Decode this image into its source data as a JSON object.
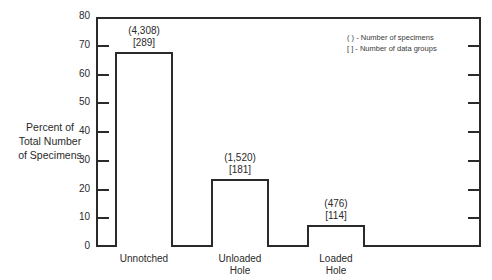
{
  "chart_data": {
    "type": "bar",
    "title": "",
    "xlabel": "",
    "ylabel": "Percent of Total Number of Specimens",
    "ylabel_lines": [
      "Percent of",
      "Total Number",
      "of Specimens"
    ],
    "ylim": [
      0,
      80
    ],
    "yticks": [
      0,
      10,
      20,
      30,
      40,
      50,
      60,
      70,
      80
    ],
    "categories": [
      "Unnotched",
      "Unloaded Hole",
      "Loaded Hole"
    ],
    "category_lines": [
      [
        "Unnotched"
      ],
      [
        "Unloaded",
        "Hole"
      ],
      [
        "Loaded",
        "Hole"
      ]
    ],
    "values": [
      68,
      23.5,
      7.5
    ],
    "annotations": [
      {
        "specimens": "(4,308)",
        "data_groups": "[289]"
      },
      {
        "specimens": "(1,520)",
        "data_groups": "[181]"
      },
      {
        "specimens": "(476)",
        "data_groups": "[114]"
      }
    ],
    "legend": [
      "(    ) - Number of specimens",
      "[    ] - Number of data groups"
    ],
    "legend_position": "upper right",
    "grid": false
  }
}
